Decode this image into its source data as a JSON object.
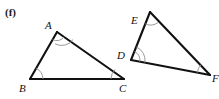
{
  "figure": {
    "part_label": "(f)",
    "background_color": "#ffffff",
    "line_color": "#111111",
    "arc_color": "#8f8f96",
    "label_color": "#111111",
    "caption": "Two similar triangles with matching angle markings"
  },
  "triangles": [
    {
      "name": "triangle-abc",
      "vertices": [
        {
          "label": "A",
          "x": 57,
          "y": 32,
          "label_x": 45,
          "label_y": 20,
          "arcs": 2
        },
        {
          "label": "B",
          "x": 30,
          "y": 79,
          "label_x": 19,
          "label_y": 83,
          "arcs": 1
        },
        {
          "label": "C",
          "x": 124,
          "y": 79,
          "label_x": 119,
          "label_y": 83,
          "arcs": 1
        }
      ],
      "sides": [
        {
          "name": "side-ab",
          "from": "A",
          "to": "B"
        },
        {
          "name": "side-bc",
          "from": "B",
          "to": "C"
        },
        {
          "name": "side-ca",
          "from": "C",
          "to": "A"
        }
      ]
    },
    {
      "name": "triangle-def",
      "vertices": [
        {
          "label": "D",
          "x": 131,
          "y": 60,
          "label_x": 117,
          "label_y": 50,
          "arcs": 2
        },
        {
          "label": "E",
          "x": 150,
          "y": 12,
          "label_x": 131,
          "label_y": 15,
          "arcs": 1
        },
        {
          "label": "F",
          "x": 210,
          "y": 75,
          "label_x": 212,
          "label_y": 73,
          "arcs": 1
        }
      ],
      "sides": [
        {
          "name": "side-de",
          "from": "D",
          "to": "E"
        },
        {
          "name": "side-ef",
          "from": "E",
          "to": "F"
        },
        {
          "name": "side-fd",
          "from": "F",
          "to": "D"
        }
      ]
    }
  ],
  "labels": {
    "A": "A",
    "B": "B",
    "C": "C",
    "D": "D",
    "E": "E",
    "F": "F",
    "part": "(f)"
  }
}
